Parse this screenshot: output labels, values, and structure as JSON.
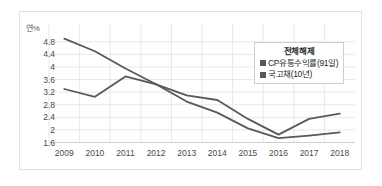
{
  "axis": {
    "unit_label": "연%",
    "y_ticks": [
      "4.8",
      "4.4",
      "4",
      "3.6",
      "3.2",
      "2.8",
      "2.4",
      "2",
      "1.6"
    ],
    "x_ticks": [
      "2009",
      "2010",
      "2011",
      "2012",
      "2013",
      "2014",
      "2015",
      "2016",
      "2017",
      "2018"
    ]
  },
  "legend": {
    "title": "전체해제",
    "items": [
      {
        "label": "CP유통수익률(91일)",
        "color": "#595959"
      },
      {
        "label": "국고채(10년)",
        "color": "#595959"
      }
    ]
  },
  "chart_data": {
    "type": "line",
    "title": "",
    "xlabel": "",
    "ylabel": "연%",
    "categories": [
      "2009",
      "2010",
      "2011",
      "2012",
      "2013",
      "2014",
      "2015",
      "2016",
      "2017",
      "2018"
    ],
    "ylim": [
      1.6,
      5.0
    ],
    "ytick_values": [
      4.8,
      4.4,
      4.0,
      3.6,
      3.2,
      2.8,
      2.4,
      2.0,
      1.6
    ],
    "grid": true,
    "legend_position": "top-right-inside",
    "series": [
      {
        "name": "CP유통수익률(91일)",
        "color": "#595959",
        "values": [
          4.9,
          4.5,
          3.95,
          3.45,
          2.9,
          2.55,
          2.05,
          1.74,
          1.82,
          1.92
        ]
      },
      {
        "name": "국고채(10년)",
        "color": "#595959",
        "values": [
          3.3,
          3.05,
          3.7,
          3.45,
          3.1,
          2.95,
          2.35,
          1.85,
          2.35,
          2.52
        ]
      }
    ]
  },
  "colors": {
    "line": "#595959",
    "grid": "#e8e8e8",
    "border": "#e2e2e2",
    "text": "#4a4a4a"
  }
}
